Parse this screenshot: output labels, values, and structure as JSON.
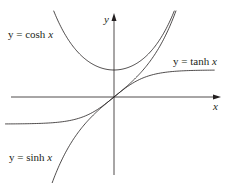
{
  "chart_data": {
    "type": "line",
    "title": "",
    "xlabel": "x",
    "ylabel": "y",
    "xlim": [
      -3.35,
      3.1
    ],
    "ylim": [
      -3.05,
      3.05
    ],
    "grid": false,
    "series": [
      {
        "name": "y = cosh x",
        "function": "cosh(x)",
        "x": [
          -1.8,
          -1.5,
          -1,
          -0.5,
          0,
          0.5,
          1,
          1.5,
          1.8
        ],
        "values": [
          3.11,
          2.35,
          1.54,
          1.13,
          1.0,
          1.13,
          1.54,
          2.35,
          3.11
        ]
      },
      {
        "name": "y = sinh x",
        "function": "sinh(x)",
        "x": [
          -1.85,
          -1.5,
          -1,
          -0.5,
          0,
          0.5,
          1,
          1.5,
          1.85
        ],
        "values": [
          -3.1,
          -2.13,
          -1.18,
          -0.52,
          0,
          0.52,
          1.18,
          2.13,
          3.1
        ]
      },
      {
        "name": "y = tanh x",
        "function": "tanh(x)",
        "x": [
          -3.3,
          -2,
          -1,
          -0.5,
          0,
          0.5,
          1,
          2,
          3.1
        ],
        "values": [
          -1.0,
          -0.96,
          -0.76,
          -0.46,
          0,
          0.46,
          0.76,
          0.96,
          1.0
        ]
      }
    ],
    "annotations": [
      "y = cosh x",
      "y = tanh x",
      "y = sinh x"
    ]
  },
  "labels": {
    "cosh": {
      "pre": "y = cosh ",
      "var": "x"
    },
    "tanh": {
      "pre": "y = tanh ",
      "var": "x"
    },
    "sinh": {
      "pre": "y = sinh ",
      "var": "x"
    },
    "x_axis": "x",
    "y_axis": "y"
  }
}
